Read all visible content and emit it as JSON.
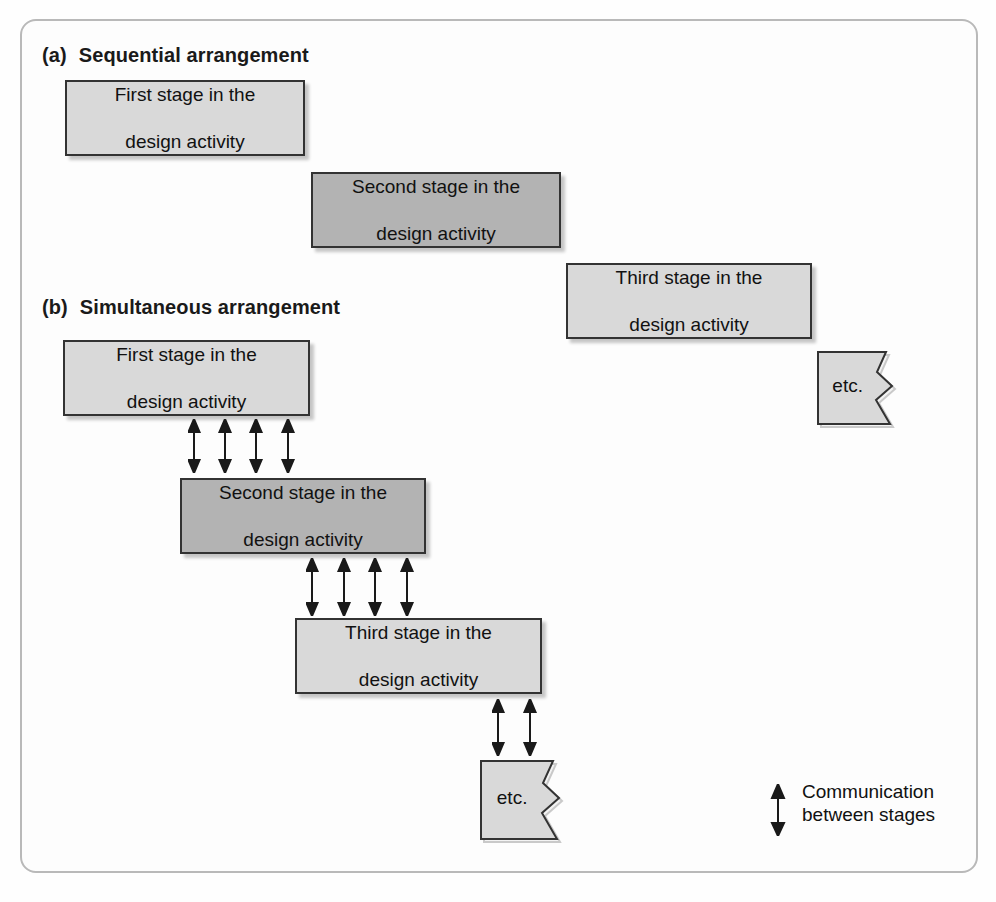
{
  "figure": {
    "sections": [
      {
        "tag": "(a)",
        "title": "Sequential arrangement",
        "boxes": [
          {
            "line1": "First stage in the",
            "line2": "design activity",
            "shade": "light"
          },
          {
            "line1": "Second stage in the",
            "line2": "design activity",
            "shade": "dark"
          },
          {
            "line1": "Third stage in the",
            "line2": "design activity",
            "shade": "light"
          }
        ],
        "etc_label": "etc."
      },
      {
        "tag": "(b)",
        "title": "Simultaneous arrangement",
        "boxes": [
          {
            "line1": "First stage in the",
            "line2": "design activity",
            "shade": "light"
          },
          {
            "line1": "Second stage in the",
            "line2": "design activity",
            "shade": "dark"
          },
          {
            "line1": "Third stage in the",
            "line2": "design activity",
            "shade": "light"
          }
        ],
        "etc_label": "etc.",
        "arrow_groups": [
          {
            "count": 4
          },
          {
            "count": 4
          },
          {
            "count": 2
          }
        ]
      }
    ],
    "legend": {
      "line1": "Communication",
      "line2": "between stages",
      "icon": "double-headed-vertical-arrow"
    },
    "colors": {
      "box_light": "#d9d9d9",
      "box_dark": "#b3b3b3",
      "box_border": "#333333",
      "frame_border": "#b9b9b9",
      "text": "#111111",
      "background": "#fefefe"
    }
  }
}
